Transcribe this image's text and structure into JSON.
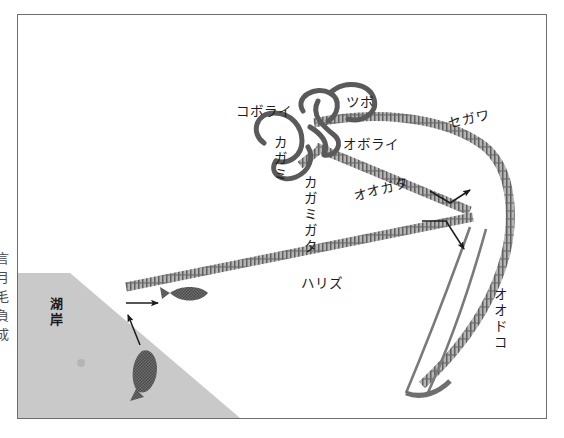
{
  "figure": {
    "edge_column_text": "言月毛負成",
    "shore_label": "湖岸",
    "labels": [
      {
        "id": "koborai",
        "text": "コボライ",
        "x": 218,
        "y": 85,
        "rot": 0,
        "vertical": false
      },
      {
        "id": "tsubo",
        "text": "ツボ",
        "x": 328,
        "y": 76,
        "rot": 0,
        "vertical": false
      },
      {
        "id": "segawa",
        "text": "セガワ",
        "x": 428,
        "y": 97,
        "rot": -12,
        "vertical": false
      },
      {
        "id": "oborai",
        "text": "オボライ",
        "x": 325,
        "y": 118,
        "rot": 0,
        "vertical": false
      },
      {
        "id": "kagami",
        "text": "カガミ",
        "x": 252,
        "y": 120,
        "rot": 0,
        "vertical": true
      },
      {
        "id": "kagamigata",
        "text": "カガミガタ",
        "x": 282,
        "y": 160,
        "rot": 0,
        "vertical": true
      },
      {
        "id": "oogata",
        "text": "オオガタ",
        "x": 333,
        "y": 170,
        "rot": -14,
        "vertical": false
      },
      {
        "id": "harisu",
        "text": "ハリズ",
        "x": 283,
        "y": 257,
        "rot": 0,
        "vertical": false
      },
      {
        "id": "oodoko",
        "text": "オオドコ",
        "x": 472,
        "y": 272,
        "rot": 0,
        "vertical": true
      }
    ]
  },
  "colors": {
    "frame_border": "#6d6d6d",
    "shore_fill": "#c9c9c9",
    "line_band": "#7d7d7d",
    "ink": "#1c1c1c",
    "fish_fill": "#6e6e6e",
    "paper": "#ffffff"
  }
}
